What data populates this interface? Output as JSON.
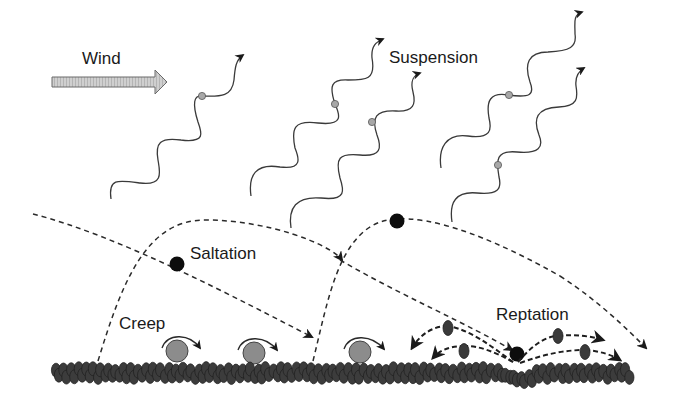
{
  "diagram": {
    "labels": {
      "wind": "Wind",
      "suspension": "Suspension",
      "saltation": "Saltation",
      "creep": "Creep",
      "reptation": "Reptation"
    },
    "colors": {
      "background": "#ffffff",
      "text": "#1a1a1a",
      "line": "#2a2a2a",
      "wind_arrow_fill": "#c8c8c8",
      "suspended_particle": "#a8a8a8",
      "creep_particle": "#8c8c8c",
      "saltating_particle": "#0d0d0d",
      "bed_grain": "#3c3c3c",
      "reptating_grain": "#3a3a3a"
    },
    "elements": {
      "wind_arrow": {
        "direction": "right"
      },
      "suspension_paths": 5,
      "suspended_particles": 5,
      "saltation_trajectories": 3,
      "saltating_particles": 3,
      "creep_particles": 3,
      "reptating_grains": 4
    }
  }
}
